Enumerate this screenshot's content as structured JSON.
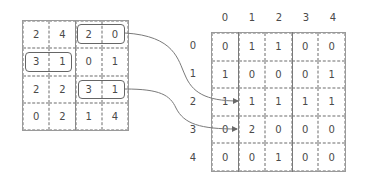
{
  "left_matrix": {
    "rows": [
      [
        "2",
        "4",
        "2",
        "0"
      ],
      [
        "3",
        "1",
        "0",
        "1"
      ],
      [
        "2",
        "2",
        "3",
        "1"
      ],
      [
        "0",
        "2",
        "1",
        "4"
      ]
    ],
    "highlighted_pairs": [
      {
        "row": 0,
        "cols": [
          2,
          3
        ],
        "values": [
          "2",
          "0"
        ]
      },
      {
        "row": 1,
        "cols": [
          0,
          1
        ],
        "values": [
          "3",
          "1"
        ]
      },
      {
        "row": 2,
        "cols": [
          2,
          3
        ],
        "values": [
          "3",
          "1"
        ]
      }
    ]
  },
  "right_matrix": {
    "col_headers": [
      "0",
      "1",
      "2",
      "3",
      "4"
    ],
    "row_headers": [
      "0",
      "1",
      "2",
      "3",
      "4"
    ],
    "rows": [
      [
        "0",
        "1",
        "1",
        "0",
        "0"
      ],
      [
        "1",
        "0",
        "0",
        "0",
        "1"
      ],
      [
        "1",
        "1",
        "1",
        "1",
        "1"
      ],
      [
        "0",
        "2",
        "0",
        "0",
        "0"
      ],
      [
        "0",
        "0",
        "1",
        "0",
        "0"
      ]
    ]
  },
  "arrows": [
    {
      "from": "left pair (2,0) at row 0",
      "to": "right cell row 2, col 1"
    },
    {
      "from": "left pair (3,1) at row 2",
      "to": "right cell row 3, col 1"
    }
  ],
  "colors": {
    "grid_line": "#9a9a9a",
    "text": "#4a4a4a",
    "arrow": "#6a6a6a"
  }
}
